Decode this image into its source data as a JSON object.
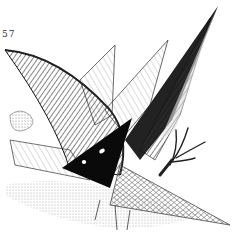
{
  "illustration": {
    "page_number": "57",
    "subject": "pen-and-ink drawing of spiky geometric wing-like forms with a black triangle bearing two white eyes and a bird-like claw",
    "colors": {
      "ink": "#111111",
      "paper": "#ffffff",
      "hatch": "#555555"
    }
  }
}
